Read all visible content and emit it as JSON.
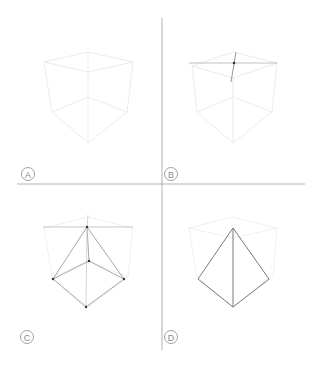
{
  "panels": [
    {
      "id": "A",
      "label": "A"
    },
    {
      "id": "B",
      "label": "B"
    },
    {
      "id": "C",
      "label": "C"
    },
    {
      "id": "D",
      "label": "D"
    }
  ],
  "colors": {
    "divider": "#9a9a9a",
    "faint_cube": "#ececec",
    "guide": "#b0b0b0",
    "construction": "#a8a8a8",
    "final": "#6e6e6e",
    "point": "#333333",
    "label": "#8a8a8a"
  }
}
